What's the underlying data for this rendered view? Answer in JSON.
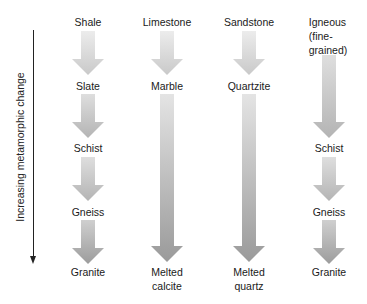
{
  "axis": {
    "label": "Increasing metamorphic change",
    "direction": "down"
  },
  "columns": [
    {
      "parent": "Shale",
      "stages": [
        "Slate",
        "Schist",
        "Gneiss",
        "Granite"
      ]
    },
    {
      "parent": "Limestone",
      "stages": [
        "Marble",
        "Melted calcite"
      ],
      "final_lines": [
        "Melted",
        "calcite"
      ]
    },
    {
      "parent": "Sandstone",
      "stages": [
        "Quartzite",
        "Melted quartz"
      ],
      "final_lines": [
        "Melted",
        "quartz"
      ]
    },
    {
      "parent": "Igneous (fine-grained)",
      "parent_lines": [
        "Igneous",
        "(fine-",
        "grained)"
      ],
      "stages": [
        "Schist",
        "Gneiss",
        "Granite"
      ]
    }
  ],
  "colors": {
    "arrow_top": "#e6e6e6",
    "arrow_bottom": "#9a9a9a",
    "text": "#1a1a1a",
    "axis": "#222222"
  }
}
